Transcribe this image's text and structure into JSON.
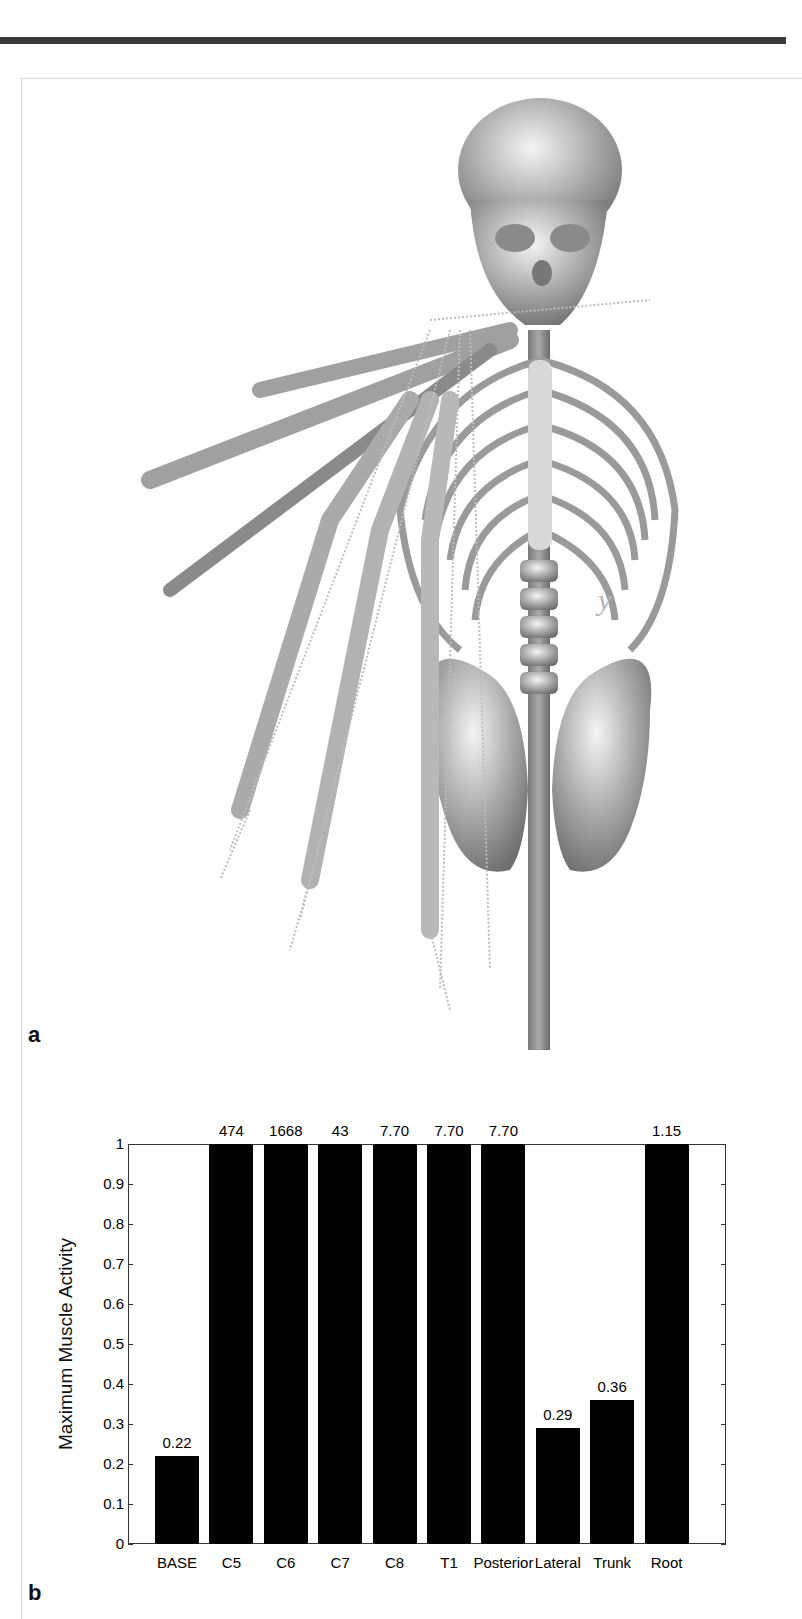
{
  "figure": {
    "panel_a_label": "a",
    "panel_b_label": "b",
    "panel_a_content": "3D musculoskeletal model of upper body skeleton with arm shown in multiple positions and muscle paths",
    "axis_marker": "y"
  },
  "chart_data": {
    "type": "bar",
    "title": "",
    "xlabel": "",
    "ylabel": "Maximum Muscle Activity",
    "ylim": [
      0,
      1
    ],
    "yticks": [
      "0",
      "0.1",
      "0.2",
      "0.3",
      "0.4",
      "0.5",
      "0.6",
      "0.7",
      "0.8",
      "0.9",
      "1"
    ],
    "categories": [
      "BASE",
      "C5",
      "C6",
      "C7",
      "C8",
      "T1",
      "Posterior",
      "Lateral",
      "Trunk",
      "Root"
    ],
    "values": [
      0.22,
      1,
      1,
      1,
      1,
      1,
      1,
      0.29,
      0.36,
      1
    ],
    "data_labels": [
      "0.22",
      "474",
      "1668",
      "43",
      "7.70",
      "7.70",
      "7.70",
      "0.29",
      "0.36",
      "1.15"
    ],
    "actual_values": [
      0.22,
      474,
      1668,
      43,
      7.7,
      7.7,
      7.7,
      0.29,
      0.36,
      1.15
    ],
    "clipped_at_ylim": [
      false,
      true,
      true,
      true,
      true,
      true,
      true,
      false,
      false,
      true
    ],
    "bar_color": "#000000",
    "grid": false,
    "legend": null
  }
}
